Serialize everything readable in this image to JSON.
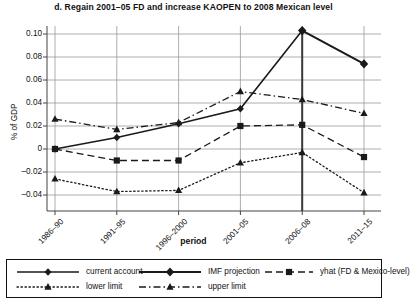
{
  "chart_data": {
    "type": "line",
    "title": "d. Regain 2001–05 FD and increase KAOPEN to 2008 Mexican level",
    "xlabel": "period",
    "ylabel": "% of GDP",
    "categories": [
      "1986–90",
      "1991–95",
      "1996–2000",
      "2001–05",
      "2006–08",
      "2011–15"
    ],
    "yticks": [
      "0.10",
      "0.08",
      "0.06",
      "0.04",
      "0.02",
      "0",
      "–0.02",
      "–0.04"
    ],
    "ytick_values": [
      0.1,
      0.08,
      0.06,
      0.04,
      0.02,
      0,
      -0.02,
      -0.04
    ],
    "ylim": [
      -0.05,
      0.11
    ],
    "grid": "horizontal-and-vertical",
    "legend_position": "bottom",
    "series": [
      {
        "name": "current account",
        "style": "solid",
        "marker": "diamond",
        "values": [
          0.0,
          0.01,
          0.022,
          0.035,
          0.103,
          null
        ]
      },
      {
        "name": "IMF projection",
        "style": "solid",
        "marker": "diamond-large",
        "values": [
          null,
          null,
          null,
          null,
          0.103,
          0.074
        ]
      },
      {
        "name": "yhat (FD & Mexico-level)",
        "style": "dashed",
        "marker": "square",
        "values": [
          0.0,
          -0.01,
          -0.01,
          0.02,
          0.021,
          -0.007
        ]
      },
      {
        "name": "lower limit",
        "style": "dotted",
        "marker": "triangle",
        "values": [
          -0.026,
          -0.037,
          -0.036,
          -0.012,
          -0.003,
          -0.038
        ]
      },
      {
        "name": "upper limit",
        "style": "dashdot",
        "marker": "triangle",
        "values": [
          0.026,
          0.017,
          0.023,
          0.05,
          0.043,
          0.031
        ]
      }
    ]
  },
  "legend": {
    "items": [
      {
        "label": "current account"
      },
      {
        "label": "IMF projection"
      },
      {
        "label": "yhat (FD & Mexico-level)"
      },
      {
        "label": "lower limit"
      },
      {
        "label": "upper limit"
      }
    ]
  },
  "colors": {
    "series": "#1a1a1a",
    "grid": "#999999",
    "axis": "#555555",
    "background": "#ffffff"
  }
}
